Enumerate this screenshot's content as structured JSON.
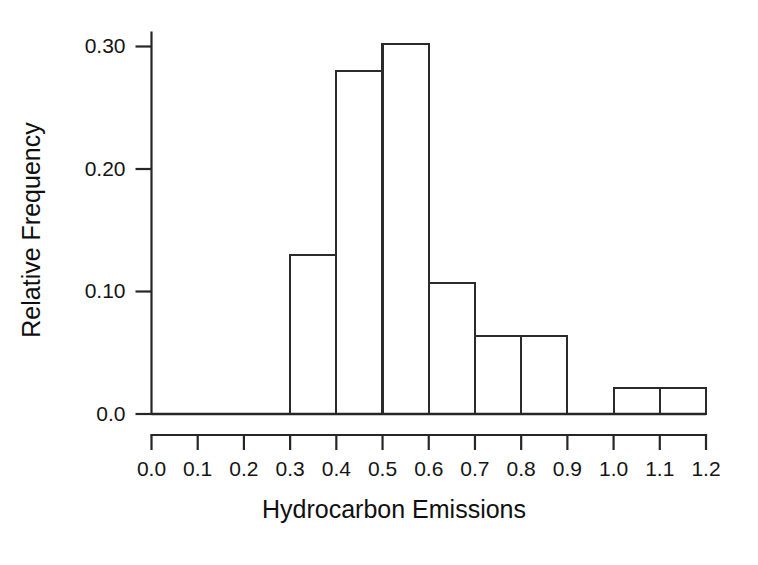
{
  "chart_data": {
    "type": "bar",
    "title": "",
    "subtitle": "",
    "xlabel": "Hydrocarbon Emissions",
    "ylabel": "Relative Frequency",
    "grid": false,
    "legend": null,
    "legend_position": "none",
    "bar_style": "histogram-outline",
    "bin_width": 0.1,
    "xlim": [
      0.0,
      1.2
    ],
    "ylim": [
      0.0,
      0.315
    ],
    "xticks": [
      0.0,
      0.1,
      0.2,
      0.3,
      0.4,
      0.5,
      0.6,
      0.7,
      0.8,
      0.9,
      1.0,
      1.1,
      1.2
    ],
    "xtick_labels": [
      "0.0",
      "0.1",
      "0.2",
      "0.3",
      "0.4",
      "0.5",
      "0.6",
      "0.7",
      "0.8",
      "0.9",
      "1.0",
      "1.1",
      "1.2"
    ],
    "yticks": [
      0.0,
      0.1,
      0.2,
      0.3
    ],
    "ytick_labels": [
      "0.0",
      "0.10",
      "0.20",
      "0.30"
    ],
    "bins": [
      {
        "x0": 0.0,
        "x1": 0.1,
        "value": 0.0
      },
      {
        "x0": 0.1,
        "x1": 0.2,
        "value": 0.0
      },
      {
        "x0": 0.2,
        "x1": 0.3,
        "value": 0.0
      },
      {
        "x0": 0.3,
        "x1": 0.4,
        "value": 0.13
      },
      {
        "x0": 0.4,
        "x1": 0.5,
        "value": 0.28
      },
      {
        "x0": 0.5,
        "x1": 0.6,
        "value": 0.302
      },
      {
        "x0": 0.6,
        "x1": 0.7,
        "value": 0.107
      },
      {
        "x0": 0.7,
        "x1": 0.8,
        "value": 0.064
      },
      {
        "x0": 0.8,
        "x1": 0.9,
        "value": 0.064
      },
      {
        "x0": 0.9,
        "x1": 1.0,
        "value": 0.0
      },
      {
        "x0": 1.0,
        "x1": 1.1,
        "value": 0.021
      },
      {
        "x0": 1.1,
        "x1": 1.2,
        "value": 0.021
      }
    ],
    "categories": [
      "0.3-0.4",
      "0.4-0.5",
      "0.5-0.6",
      "0.6-0.7",
      "0.7-0.8",
      "0.8-0.9",
      "1.0-1.1",
      "1.1-1.2"
    ],
    "values": [
      0.13,
      0.28,
      0.302,
      0.107,
      0.064,
      0.064,
      0.021,
      0.021
    ],
    "colors": {
      "background": "#ffffff",
      "bar_fill": "#ffffff",
      "bar_stroke": "#2b2b2b",
      "axis": "#262626",
      "text": "#141414"
    }
  }
}
